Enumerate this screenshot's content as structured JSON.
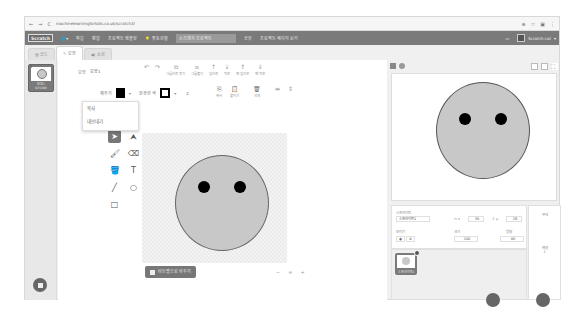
{
  "browser": {
    "url": "machinelearningforkids.co.uk/scratch3/",
    "nav": [
      "←",
      "→",
      "C"
    ],
    "right_icons": [
      "zoom-icon",
      "star-icon",
      "extension-icon",
      "menu-icon"
    ]
  },
  "menubar": {
    "logo": "Scratch",
    "language_icon": "globe-icon",
    "items": [
      "파일",
      "편집",
      "프로젝트 템플릿",
      "튜토리얼"
    ],
    "project_title": "스크래치 프로젝트",
    "share": "공유",
    "see_project": "프로젝트 페이지 보기",
    "username": "Scratch-cat"
  },
  "tabs": [
    {
      "label": "코드",
      "icon": "code-icon"
    },
    {
      "label": "모양",
      "icon": "brush-icon",
      "active": true
    },
    {
      "label": "소리",
      "icon": "sound-icon"
    }
  ],
  "costumes": [
    {
      "number": "1",
      "name": "모양1",
      "size": "97x100"
    }
  ],
  "context_menu": {
    "items": [
      "복사",
      "내보내기"
    ]
  },
  "editor": {
    "costume_label": "모양",
    "costume_name": "모양1",
    "toolbar": {
      "undo": "↶",
      "redo": "↷",
      "group": "그룹으로 묶기",
      "ungroup": "그룹풀기",
      "forward": "앞으로",
      "backward": "뒤로",
      "front": "맨 앞으로",
      "back": "맨 뒤로",
      "copy": "복사",
      "paste": "붙이기",
      "delete": "삭제",
      "flip_h": "좌우",
      "flip_v": "상하"
    },
    "fill_label": "채우기",
    "outline_label": "윤곽선 색",
    "outline_width": "2",
    "convert_button": "비트맵으로 바꾸기",
    "zoom": [
      "−",
      "=",
      "+"
    ]
  },
  "canvas": {
    "face_color": "#c8c8c8",
    "eye_color": "#000000"
  },
  "stage": {
    "controls": [
      "green-flag",
      "stop"
    ],
    "layout_buttons": [
      "small-stage",
      "normal-stage",
      "fullscreen"
    ]
  },
  "sprite_info": {
    "sprite_label": "스프라이트",
    "sprite_name": "스프라이트1",
    "x_label": "x",
    "x_value": "36",
    "y_label": "y",
    "y_value": "28",
    "show_label": "보이기",
    "size_label": "크기",
    "size_value": "100",
    "direction_label": "방향",
    "direction_value": "90"
  },
  "sprites": [
    {
      "name": "스프라이트1"
    }
  ],
  "stage_pane": {
    "label": "무대",
    "backdrops_label": "배경",
    "backdrops_count": "1"
  }
}
